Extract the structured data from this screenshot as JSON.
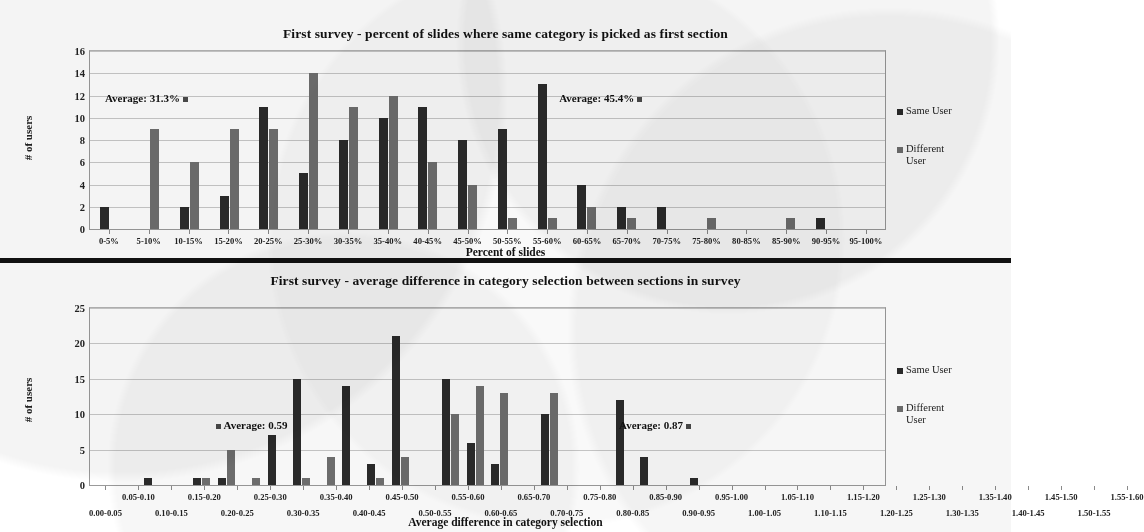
{
  "figure": {
    "legend": [
      {
        "key": "same",
        "label": "Same User",
        "color": "#2b2b2b"
      },
      {
        "key": "diff",
        "label": "Different User",
        "color": "#6f6f6f"
      }
    ]
  },
  "chart_data": [
    {
      "type": "bar",
      "title": "First survey - percent of slides where same category is picked as first section",
      "xlabel": "Percent of slides",
      "ylabel": "# of users",
      "ylim": [
        0,
        16
      ],
      "yticks": [
        0,
        2,
        4,
        6,
        8,
        10,
        12,
        14,
        16
      ],
      "grid": true,
      "legend_position": "right",
      "categories": [
        "0-5%",
        "5-10%",
        "10-15%",
        "15-20%",
        "20-25%",
        "25-30%",
        "30-35%",
        "35-40%",
        "40-45%",
        "45-50%",
        "50-55%",
        "55-60%",
        "60-65%",
        "65-70%",
        "70-75%",
        "75-80%",
        "80-85%",
        "85-90%",
        "90-95%",
        "95-100%"
      ],
      "series": [
        {
          "name": "Same User",
          "color": "#2b2b2b",
          "values": [
            2,
            0,
            2,
            3,
            11,
            5,
            8,
            10,
            11,
            8,
            9,
            13,
            4,
            2,
            2,
            0,
            0,
            0,
            1,
            0
          ]
        },
        {
          "name": "Different User",
          "color": "#6f6f6f",
          "values": [
            0,
            9,
            6,
            9,
            9,
            14,
            11,
            12,
            6,
            4,
            1,
            1,
            2,
            1,
            0,
            1,
            0,
            1,
            0,
            0
          ]
        }
      ],
      "annotations": [
        {
          "text": "Average: 31.3%",
          "marker": "right",
          "x_frac": 0.02,
          "y_value": 11.6
        },
        {
          "text": "Average: 45.4%",
          "marker": "right",
          "x_frac": 0.59,
          "y_value": 11.6
        }
      ]
    },
    {
      "type": "bar",
      "title": "First survey - average difference in category selection between sections in survey",
      "xlabel": "Average difference in category selection",
      "ylabel": "# of users",
      "ylim": [
        0,
        25
      ],
      "yticks": [
        0,
        5,
        10,
        15,
        20,
        25
      ],
      "grid": true,
      "legend_position": "right",
      "categories": [
        "0.00-0.05",
        "0.05-0.10",
        "0.10-0.15",
        "0.15-0.20",
        "0.20-0.25",
        "0.25-0.30",
        "0.30-0.35",
        "0.35-0.40",
        "0.40-0.45",
        "0.45-0.50",
        "0.50-0.55",
        "0.55-0.60",
        "0.60-0.65",
        "0.65-0.70",
        "0.70-0.75",
        "0.75-0.80",
        "0.80-0.85",
        "0.85-0.90",
        "0.90-0.95",
        "0.95-1.00",
        "1.00-1.05",
        "1.05-1.10",
        "1.10-1.15",
        "1.15-1.20",
        "1.20-1.25",
        "1.25-1.30",
        "1.30-1.35",
        "1.35-1.40",
        "1.40-1.45",
        "1.45-1.50",
        "1.50-1.55",
        "1.55-1.60"
      ],
      "series": [
        {
          "name": "Same User",
          "color": "#2b2b2b",
          "values": [
            0,
            0,
            1,
            0,
            1,
            1,
            0,
            7,
            15,
            0,
            14,
            3,
            21,
            0,
            15,
            6,
            3,
            0,
            10,
            0,
            0,
            12,
            4,
            0,
            1,
            0,
            0,
            0,
            0,
            0,
            0,
            0
          ]
        },
        {
          "name": "Different User",
          "color": "#6f6f6f",
          "values": [
            0,
            0,
            0,
            0,
            1,
            5,
            1,
            0,
            1,
            4,
            0,
            1,
            4,
            0,
            10,
            14,
            13,
            0,
            13,
            0,
            0,
            0,
            0,
            0,
            0,
            0,
            0,
            0,
            0,
            0,
            0,
            0
          ]
        }
      ],
      "annotations": [
        {
          "text": "Average: 0.59",
          "marker": "left",
          "x_frac": 0.155,
          "y_value": 8.2
        },
        {
          "text": "Average: 0.87",
          "marker": "right",
          "x_frac": 0.665,
          "y_value": 8.2
        }
      ]
    }
  ]
}
